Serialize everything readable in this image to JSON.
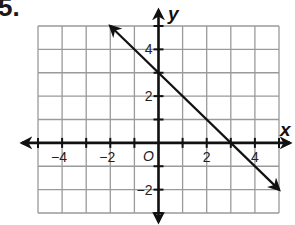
{
  "problem": {
    "number": "5."
  },
  "chart_data": {
    "type": "line",
    "title": "",
    "xlabel": "x",
    "ylabel": "y",
    "origin_label": "O",
    "xlim": [
      -5,
      5
    ],
    "ylim": [
      -3,
      5
    ],
    "grid": true,
    "x_tick_labels": [
      {
        "value": -4,
        "label": "−4"
      },
      {
        "value": -2,
        "label": "−2"
      },
      {
        "value": 2,
        "label": "2"
      },
      {
        "value": 4,
        "label": "4"
      }
    ],
    "y_tick_labels": [
      {
        "value": 4,
        "label": "4"
      },
      {
        "value": 2,
        "label": "2"
      },
      {
        "value": -2,
        "label": "−2"
      }
    ],
    "series": [
      {
        "name": "line",
        "equation": "y = -x + 3",
        "slope": -1,
        "y_intercept": 3,
        "x_intercept": 3,
        "x": [
          -2,
          5
        ],
        "y": [
          5,
          -2
        ],
        "arrows": "both"
      }
    ],
    "colors": {
      "grid": "#9a9a9a",
      "axis": "#111111",
      "line": "#111111"
    }
  }
}
